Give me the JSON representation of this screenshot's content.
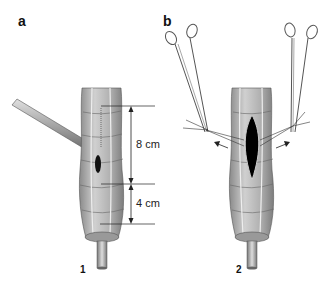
{
  "panels": [
    {
      "label": "a",
      "step": "1",
      "measurements": [
        {
          "label": "8 cm"
        },
        {
          "label": "4 cm"
        }
      ],
      "elements": [
        "colon-segment",
        "tube-instrument",
        "small-incision",
        "stapler-rod"
      ]
    },
    {
      "label": "b",
      "step": "2",
      "elements": [
        "colon-segment",
        "opened-incision",
        "left-hemostat",
        "right-hemostat",
        "stay-sutures",
        "traction-arrows",
        "stapler-rod"
      ]
    }
  ],
  "colors": {
    "background": "#ffffff",
    "tissue": "#b5b5b5",
    "tissue_dark": "#7a7a7a",
    "line": "#222222",
    "incision": "#000000"
  }
}
